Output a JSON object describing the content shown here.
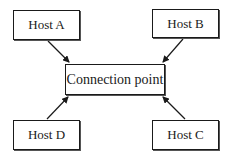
{
  "diagram": {
    "hub": {
      "label": "Connection point"
    },
    "hosts": [
      {
        "id": "A",
        "label": "Host A",
        "position": "top-left"
      },
      {
        "id": "B",
        "label": "Host B",
        "position": "top-right"
      },
      {
        "id": "C",
        "label": "Host C",
        "position": "bottom-right"
      },
      {
        "id": "D",
        "label": "Host D",
        "position": "bottom-left"
      }
    ],
    "edges": [
      {
        "from": "Host A",
        "to": "Connection point",
        "direction": "toward-hub"
      },
      {
        "from": "Host B",
        "to": "Connection point",
        "direction": "toward-hub"
      },
      {
        "from": "Host C",
        "to": "Connection point",
        "direction": "toward-hub"
      },
      {
        "from": "Host D",
        "to": "Connection point",
        "direction": "toward-hub"
      }
    ],
    "colors": {
      "line": "#1a1a1a",
      "background": "#ffffff"
    }
  }
}
